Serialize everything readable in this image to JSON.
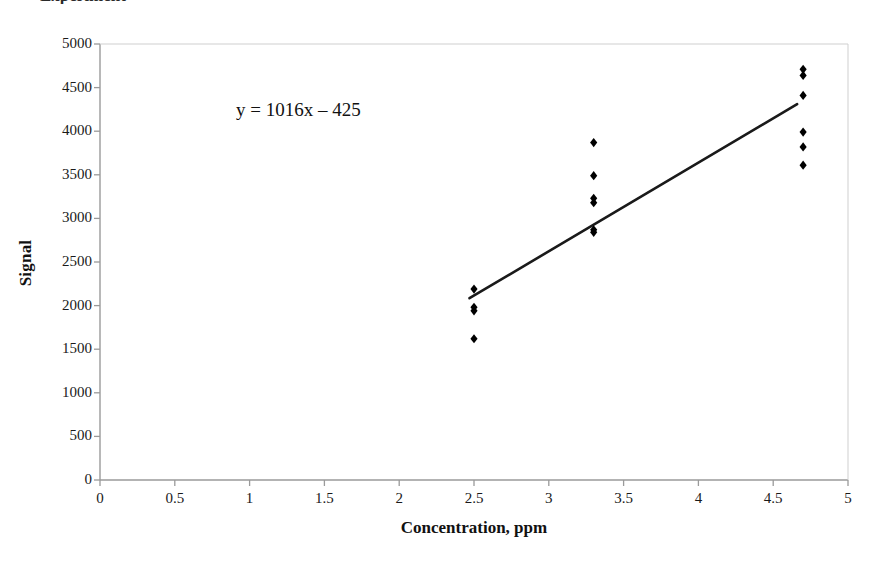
{
  "figure": {
    "title_remnant": "Experiment",
    "background": "#ffffff"
  },
  "chart_data": {
    "type": "scatter",
    "title": "",
    "xlabel": "Concentration, ppm",
    "ylabel": "Signal",
    "xlim": [
      0,
      5
    ],
    "ylim": [
      0,
      5000
    ],
    "xticks": [
      0,
      0.5,
      1,
      1.5,
      2,
      2.5,
      3,
      3.5,
      4,
      4.5,
      5
    ],
    "xtick_labels": [
      "0",
      "0.5",
      "1",
      "1.5",
      "2",
      "2.5",
      "3",
      "3.5",
      "4",
      "4.5",
      "5"
    ],
    "yticks": [
      0,
      500,
      1000,
      1500,
      2000,
      2500,
      3000,
      3500,
      4000,
      4500,
      5000
    ],
    "ytick_labels": [
      "0",
      "500",
      "1000",
      "1500",
      "2000",
      "2500",
      "3000",
      "3500",
      "4000",
      "4500",
      "5000"
    ],
    "grid": false,
    "legend": false,
    "marker": "diamond",
    "marker_color": "#000000",
    "series": [
      {
        "name": "Calibration data",
        "points": [
          {
            "x": 2.5,
            "y": 2190
          },
          {
            "x": 2.5,
            "y": 1980
          },
          {
            "x": 2.5,
            "y": 1940
          },
          {
            "x": 2.5,
            "y": 1620
          },
          {
            "x": 3.3,
            "y": 3870
          },
          {
            "x": 3.3,
            "y": 3490
          },
          {
            "x": 3.3,
            "y": 3230
          },
          {
            "x": 3.3,
            "y": 3180
          },
          {
            "x": 3.3,
            "y": 2870
          },
          {
            "x": 3.3,
            "y": 2840
          },
          {
            "x": 4.7,
            "y": 4710
          },
          {
            "x": 4.7,
            "y": 4640
          },
          {
            "x": 4.7,
            "y": 4410
          },
          {
            "x": 4.7,
            "y": 3990
          },
          {
            "x": 4.7,
            "y": 3820
          },
          {
            "x": 4.7,
            "y": 3610
          }
        ]
      }
    ],
    "trendline": {
      "equation_text": "y = 1016x – 425",
      "slope": 1016,
      "intercept": -425,
      "x_start": 2.47,
      "x_end": 4.66,
      "color": "#1a1a1a"
    },
    "annotations": [
      {
        "text": "y = 1016x – 425",
        "x": 1.55,
        "y": 3950
      }
    ]
  }
}
